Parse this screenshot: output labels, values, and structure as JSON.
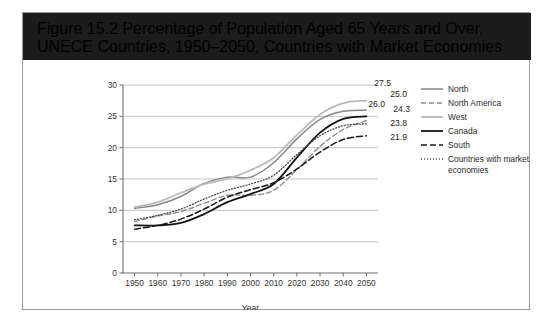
{
  "figure": {
    "title_line1": "Figure 15.2 Percentage of Population Aged 65 Years and Over, UNECE Countries,",
    "title_line2": "1950–2050, Countries with Market Economies",
    "title_bar_color": "#1c1c1c",
    "frame_border_color": "#9a9a9a"
  },
  "chart_data": {
    "type": "line",
    "title": "Figure 15.2 Percentage of Population Aged 65 Years and Over, UNECE Countries, 1950–2050, Countries with Market Economies",
    "xlabel": "Year",
    "ylabel": "",
    "x": [
      1950,
      1960,
      1970,
      1980,
      1990,
      2000,
      2010,
      2020,
      2030,
      2040,
      2050
    ],
    "xlim": [
      1945,
      2055
    ],
    "ylim": [
      0,
      30
    ],
    "yticks": [
      0,
      5,
      10,
      15,
      20,
      25,
      30
    ],
    "xticks": [
      1950,
      1960,
      1970,
      1980,
      1990,
      2000,
      2010,
      2020,
      2030,
      2040,
      2050
    ],
    "grid": "horizontal",
    "legend_position": "right",
    "series": [
      {
        "name": "North",
        "color": "#888888",
        "width": 1.5,
        "dash": "none",
        "values": [
          10.3,
          10.9,
          12.2,
          14.3,
          15.3,
          15.3,
          17.6,
          21.4,
          24.5,
          25.8,
          26.0
        ],
        "end_label": "26.0"
      },
      {
        "name": "North America",
        "color": "#8d8d8d",
        "width": 1.4,
        "dash": "5,3",
        "values": [
          8.2,
          9.1,
          9.8,
          11.1,
          12.4,
          12.4,
          13.2,
          16.5,
          20.2,
          22.9,
          24.3
        ],
        "end_label": "24.3"
      },
      {
        "name": "West",
        "color": "#b9b9b9",
        "width": 1.8,
        "dash": "none",
        "values": [
          10.5,
          11.3,
          12.8,
          14.2,
          15.0,
          16.4,
          18.4,
          22.0,
          25.3,
          27.1,
          27.5
        ],
        "end_label": "27.5"
      },
      {
        "name": "Canada",
        "color": "#121212",
        "width": 1.8,
        "dash": "none",
        "values": [
          7.6,
          7.6,
          8.0,
          9.4,
          11.3,
          12.6,
          14.2,
          18.4,
          22.4,
          24.6,
          25.0
        ],
        "end_label": "25.0"
      },
      {
        "name": "South",
        "color": "#1a1a1a",
        "width": 1.5,
        "dash": "6,3",
        "values": [
          7.0,
          7.6,
          8.6,
          10.2,
          12.1,
          13.3,
          14.4,
          16.6,
          19.3,
          21.3,
          21.9
        ],
        "end_label": "21.9"
      },
      {
        "name": "Countries with market economies",
        "color": "#4a4a4a",
        "width": 1.3,
        "dash": "1,2",
        "values": [
          8.5,
          9.2,
          10.2,
          11.8,
          13.2,
          14.2,
          15.6,
          18.9,
          21.9,
          23.5,
          23.8
        ],
        "end_label": "23.8"
      }
    ],
    "value_labels": [
      {
        "text": "27.5",
        "series": "West"
      },
      {
        "text": "25.0",
        "series": "Canada"
      },
      {
        "text": "26.0",
        "series": "North"
      },
      {
        "text": "24.3",
        "series": "North America"
      },
      {
        "text": "23.8",
        "series": "Countries with market economies"
      },
      {
        "text": "21.9",
        "series": "South"
      }
    ]
  },
  "legend": {
    "items": [
      {
        "label": "North"
      },
      {
        "label": "North America"
      },
      {
        "label": "West"
      },
      {
        "label": "Canada"
      },
      {
        "label": "South"
      },
      {
        "label": "Countries with market"
      },
      {
        "label": "economies"
      }
    ]
  },
  "axis": {
    "x_title": "Year"
  }
}
